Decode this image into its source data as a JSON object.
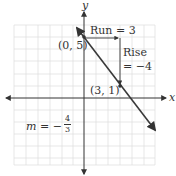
{
  "axes": {
    "x_label": "x",
    "y_label": "y"
  },
  "points": [
    {
      "label": "(0, 5)",
      "x": 0,
      "y": 5
    },
    {
      "label": "(3, 1)",
      "x": 3,
      "y": 1
    }
  ],
  "annotations": {
    "run": "Run = 3",
    "rise_line1": "Rise",
    "rise_line2": "= −4",
    "slope_prefix": "m = −",
    "slope_num": "4",
    "slope_den": "3"
  },
  "colors": {
    "line": "#3a3a3a",
    "grid": "#d9d9d9",
    "axis": "#333333"
  }
}
